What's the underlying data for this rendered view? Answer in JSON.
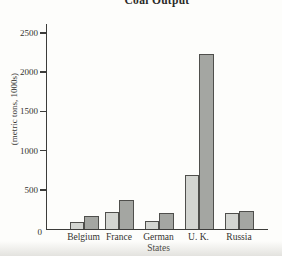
{
  "title": "Coal Output",
  "chart_data": {
    "type": "bar",
    "title": "Coal Output",
    "categories": [
      "Belgium",
      "France",
      "German States",
      "U. K.",
      "Russia"
    ],
    "category_labels": [
      "Belgium",
      "France",
      "German\nStates",
      "U. K.",
      "Russia"
    ],
    "series": [
      {
        "name": "series 1 (light gray bars)",
        "values": [
          90,
          220,
          100,
          690,
          200
        ]
      },
      {
        "name": "series 2 (dark gray bars)",
        "values": [
          160,
          370,
          210,
          2230,
          230
        ]
      }
    ],
    "ylabel": "(metric tons, 1000s)",
    "ylim": [
      0,
      2600
    ],
    "yticks": [
      0,
      500,
      1000,
      1500,
      2000,
      2500
    ],
    "grid": false,
    "legend_position": "none",
    "colors": {
      "series1": "#d3d5d1",
      "series2": "#a4a6a2",
      "bar_border": "#4f4f4c",
      "axis": "#3c3c3a",
      "text": "#34332f",
      "background": "#fdfdfb"
    }
  }
}
